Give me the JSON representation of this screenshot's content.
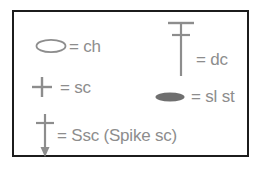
{
  "legend": {
    "title": "Crochet stitch symbol key",
    "border_color": "#1c1c1c",
    "text_color": "#8d8d8d",
    "background": "#ffffff",
    "entries": [
      {
        "symbol": "open-oval",
        "symbol_name": "chain-stitch-symbol",
        "equals": "=",
        "label": "= ch",
        "abbreviation": "ch",
        "meaning": "chain"
      },
      {
        "symbol": "plus-cross",
        "symbol_name": "single-crochet-symbol",
        "equals": "=",
        "label": "= sc",
        "abbreviation": "sc",
        "meaning": "single crochet"
      },
      {
        "symbol": "cross-with-down-arrow",
        "symbol_name": "spike-single-crochet-symbol",
        "equals": "=",
        "label": "= Ssc (Spike sc)",
        "abbreviation": "Ssc",
        "meaning": "Spike sc"
      },
      {
        "symbol": "vertical-bar-with-top-bar-and-crossbar",
        "symbol_name": "double-crochet-symbol",
        "equals": "=",
        "label": "= dc",
        "abbreviation": "dc",
        "meaning": "double crochet"
      },
      {
        "symbol": "filled-oval",
        "symbol_name": "slip-stitch-symbol",
        "equals": "=",
        "label": "= sl st",
        "abbreviation": "sl st",
        "meaning": "slip stitch"
      }
    ]
  }
}
